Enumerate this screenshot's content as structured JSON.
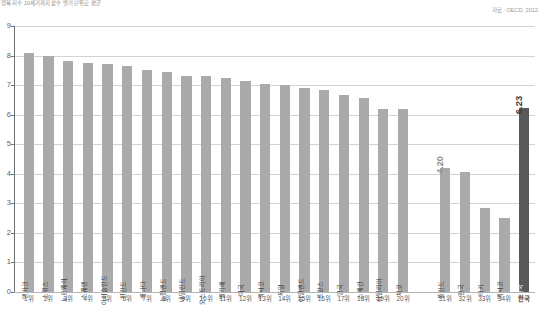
{
  "header": {
    "title": "행복 지수 10세기까지 삶수 별의 단위로 평균",
    "source": "자료 : OECD, 2012"
  },
  "axis": {
    "y_ticks": [
      "0",
      "1",
      "2",
      "3",
      "4",
      "5",
      "6",
      "7",
      "8",
      "9"
    ],
    "ylim": [
      0,
      9
    ]
  },
  "chart_data": {
    "type": "bar",
    "title": "행복 지수 10세기까지 삶수 별의 단위로 평균",
    "subtitle": "",
    "source": "자료 : OECD, 2012",
    "xlabel": "",
    "ylabel": "",
    "ylim": [
      0,
      9
    ],
    "grid": true,
    "legend": "none",
    "categories": [
      "덴마크",
      "스위스",
      "노르웨이",
      "스웨덴",
      "아이슬란드",
      "핀란드",
      "캐나다",
      "뉴질랜드",
      "네덜란드",
      "오스트리아",
      "벨기에",
      "미국",
      "멕시코",
      "독일",
      "아일랜드",
      "프랑스",
      "영국",
      "스페인",
      "이탈리아",
      "체코",
      "폴란드",
      "한국",
      "터키",
      "멕시코",
      "한국"
    ],
    "rank_labels": [
      "1위",
      "2위",
      "3위",
      "4위",
      "5위",
      "6위",
      "7위",
      "8위",
      "9위",
      "10위",
      "11위",
      "12위",
      "13위",
      "14위",
      "15위",
      "16위",
      "17위",
      "18위",
      "19위",
      "20위",
      "31위",
      "32위",
      "33위",
      "34위",
      "한국"
    ],
    "values": [
      8.1,
      8.0,
      7.8,
      7.75,
      7.7,
      7.65,
      7.5,
      7.45,
      7.3,
      7.3,
      7.25,
      7.15,
      7.05,
      7.0,
      6.9,
      6.85,
      6.65,
      6.55,
      6.2,
      6.2,
      4.2,
      4.05,
      2.85,
      2.5,
      6.23
    ],
    "value_labels": {
      "20": "4.20",
      "24": "6.23"
    },
    "highlight_index": 24,
    "gap_after_index": 19,
    "colors": {
      "bar": "#aaaaaa",
      "bar_highlight": "#595959",
      "grid": "#d3d3d3",
      "axis": "#6f6f6f",
      "text": "#4a4a4a",
      "label_muted": "#8f8f8f"
    }
  }
}
